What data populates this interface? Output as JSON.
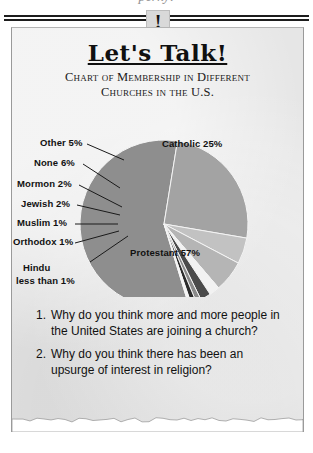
{
  "page": {
    "top_cut_text": "perky!",
    "badge_icon": "exclamation-icon",
    "badge_glyph": "!"
  },
  "header": {
    "title_part1": "Let",
    "title_part2": "'s",
    "title_part3": " Talk!",
    "title_full": "Let's Talk!",
    "subtitle_line1": "Chart of Membership in Different",
    "subtitle_line2": "Churches in the U.S."
  },
  "chart_data": {
    "type": "pie",
    "title": "Chart of Membership in Different Churches in the U.S.",
    "categories": [
      "Protestant",
      "Catholic",
      "Other",
      "None",
      "Mormon",
      "Jewish",
      "Muslim",
      "Orthodox",
      "Hindu"
    ],
    "values": [
      57,
      25,
      5,
      6,
      2,
      2,
      1,
      1,
      0.5
    ],
    "labels": [
      "Protestant 57%",
      "Catholic 25%",
      "Other 5%",
      "None 6%",
      "Mormon 2%",
      "Jewish 2%",
      "Muslim 1%",
      "Orthodox 1%",
      "Hindu less than 1%"
    ],
    "colors": [
      "#8e8e8e",
      "#a3a3a3",
      "#c2c2c2",
      "#b5b5b5",
      "#f2f2f2",
      "#4a4a4a",
      "#8a8a8a",
      "#2b2b2b",
      "#f5f5f5"
    ],
    "inside_labels": [
      "Protestant 57%",
      "Catholic 25%"
    ],
    "outside_labels": [
      "Other 5%",
      "None 6%",
      "Mormon 2%",
      "Jewish 2%",
      "Muslim 1%",
      "Orthodox 1%",
      "Hindu less than 1%"
    ],
    "hindu_label_line1": "Hindu",
    "hindu_label_line2": "less than 1%",
    "legend": "none",
    "grid": false
  },
  "questions": [
    {
      "number": "1.",
      "text": "Why do you think more and more people in the United States are joining a church?"
    },
    {
      "number": "2.",
      "text": "Why do you think there has been an upsurge of interest in religion?"
    }
  ]
}
